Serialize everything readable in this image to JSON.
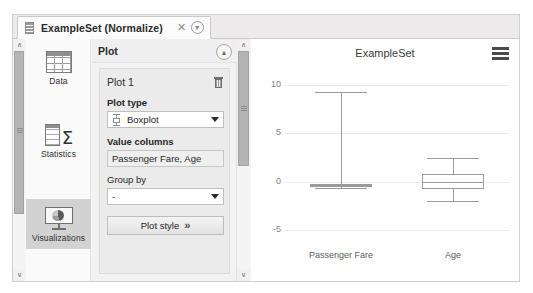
{
  "window": {
    "tab": {
      "icon": "table-icon",
      "title": "ExampleSet (Normalize)",
      "close_label": "✕",
      "detach_label": "ⓡ"
    }
  },
  "nav_rail": {
    "items": [
      {
        "label": "Data",
        "icon": "table-icon",
        "selected": false
      },
      {
        "label": "Statistics",
        "icon": "sigma-table-icon",
        "selected": false
      },
      {
        "label": "Visualizations",
        "icon": "chart-presentation-icon",
        "selected": true
      }
    ]
  },
  "plot_panel": {
    "header_title": "Plot",
    "collapse_icon": "chevron-double-up-icon",
    "card": {
      "name": "Plot 1",
      "delete_icon": "trash-icon",
      "plot_type_label": "Plot type",
      "plot_type_value": "Boxplot",
      "plot_type_icon": "boxplot-icon",
      "value_columns_label": "Value columns",
      "value_columns_value": "Passenger Fare, Age",
      "group_by_label": "Group by",
      "group_by_value": "-",
      "plot_style_label": "Plot style",
      "plot_style_chevrons": "»"
    }
  },
  "chart_data": {
    "type": "box",
    "title": "ExampleSet",
    "xlabel": "",
    "ylabel": "",
    "ylim": [
      -6,
      11
    ],
    "yticks": [
      10,
      5,
      0,
      -5
    ],
    "ytick_labels": [
      "10",
      "5",
      "0",
      "-5"
    ],
    "grid": true,
    "legend": null,
    "categories": [
      "Passenger Fare",
      "Age"
    ],
    "boxes": [
      {
        "name": "Passenger Fare",
        "whisker_low": -0.65,
        "q1": -0.55,
        "median": -0.38,
        "q3": -0.2,
        "whisker_high": 9.3
      },
      {
        "name": "Age",
        "whisker_low": -2.0,
        "q1": -0.72,
        "median": 0.02,
        "q3": 0.78,
        "whisker_high": 2.45
      }
    ]
  },
  "chart_menu": {
    "icon": "hamburger-menu-icon"
  },
  "scrollbars": {
    "up_arrow": "∧",
    "down_arrow": "∨"
  },
  "colors": {
    "accent": "#d2d2d2",
    "panel": "#f2f2f2",
    "chart_stroke": "#9b9b9b",
    "grid": "#ebebeb"
  }
}
